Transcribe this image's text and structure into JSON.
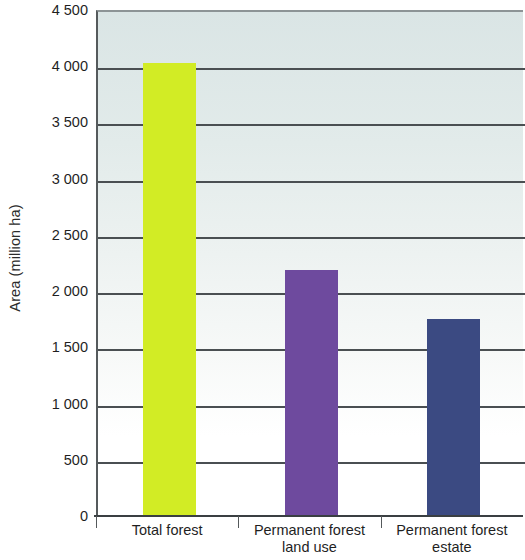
{
  "chart_data": {
    "type": "bar",
    "title": "",
    "xlabel": "",
    "ylabel": "Area (million ha)",
    "ylim": [
      0,
      4500
    ],
    "ytick_step": 500,
    "grid": true,
    "legend": "none",
    "categories": [
      "Total forest",
      "Permanent forest land use",
      "Permanent forest estate"
    ],
    "values": [
      4030,
      2185,
      1750
    ],
    "bar_colors": [
      "#d2ec25",
      "#6e4a9e",
      "#3b4a82"
    ],
    "ytick_labels": [
      "4 500",
      "4 000",
      "3 500",
      "3 000",
      "2 500",
      "2 000",
      "1 500",
      "1 000",
      "500",
      "0"
    ],
    "ytick_values": [
      4500,
      4000,
      3500,
      3000,
      2500,
      2000,
      1500,
      1000,
      500,
      0
    ],
    "series": [
      {
        "name": "Area",
        "points": [
          {
            "category_line1": "Total forest",
            "category_line2": "",
            "value": 4030,
            "color": "#d2ec25"
          },
          {
            "category_line1": "Permanent forest",
            "category_line2": "land use",
            "value": 2185,
            "color": "#6e4a9e"
          },
          {
            "category_line1": "Permanent forest",
            "category_line2": "estate",
            "value": 1750,
            "color": "#3b4a82"
          }
        ]
      }
    ],
    "plot_background_top_color": "#dae5e5",
    "plot_background_bottom_color": "#ffffff",
    "gridline_color": "#4a4f52",
    "axis_color": "#3a3f42",
    "text_color": "#1f1f1f"
  }
}
